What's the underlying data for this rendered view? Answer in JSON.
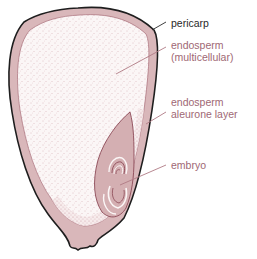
{
  "diagram": {
    "type": "seed cross-section",
    "colors": {
      "pericarp_fill": "#d9b7ba",
      "endosperm_fill": "#fbf6f6",
      "embryo_fill": "#d4afb2",
      "outline": "#1e1e1e",
      "leader_dark": "#2a2a2a",
      "leader_pink": "#b07a84",
      "text_dark": "#2a2a2a",
      "text_pink": "#a06874"
    },
    "labels": [
      {
        "id": "pericarp",
        "lines": [
          "pericarp"
        ],
        "color": "dark"
      },
      {
        "id": "endosperm-multicellular",
        "lines": [
          "endosperm",
          "(multicellular)"
        ],
        "color": "pink"
      },
      {
        "id": "endosperm-aleurone-layer",
        "lines": [
          "endosperm",
          "aleurone layer"
        ],
        "color": "pink"
      },
      {
        "id": "embryo",
        "lines": [
          "embryo"
        ],
        "color": "pink"
      }
    ]
  }
}
